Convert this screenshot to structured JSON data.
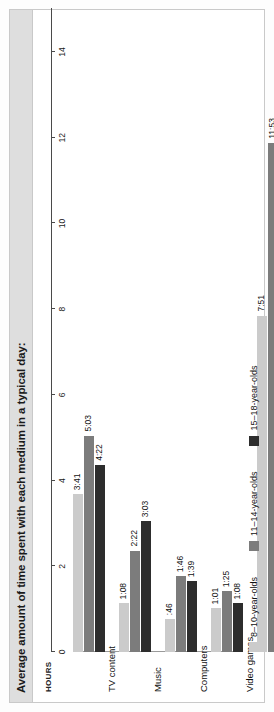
{
  "figure": {
    "title": "Average amount of time spent with each medium in a typical day:"
  },
  "chart_data": {
    "type": "bar",
    "orientation": "horizontal",
    "title": "Average amount of time spent with each medium in a typical day:",
    "xlabel": "HOURS",
    "ylabel": "",
    "axis_title": "HOURS",
    "xlim": [
      0,
      14
    ],
    "ticks": [
      0,
      2,
      4,
      6,
      8,
      10,
      12,
      14
    ],
    "tick_labels": [
      "0",
      "2",
      "4",
      "6",
      "8",
      "10",
      "12",
      "14"
    ],
    "grid": false,
    "legend_position": "bottom",
    "categories": [
      "TV content",
      "Music",
      "Computers",
      "Video games",
      "Total media exposure",
      "Total media use"
    ],
    "series": [
      {
        "name": "8–10-year-olds",
        "color": "#cbcbcb",
        "labels": [
          "3:41",
          "1:08",
          ":46",
          "1:01",
          "7:51",
          "5:29"
        ],
        "values": [
          3.683,
          1.133,
          0.767,
          1.017,
          7.85,
          5.483
        ]
      },
      {
        "name": "11–14-year-olds",
        "color": "#7c7c7c",
        "labels": [
          "5:03",
          "2:22",
          "1:46",
          "1:25",
          "11:53",
          "8:40"
        ],
        "values": [
          5.05,
          2.367,
          1.767,
          1.417,
          11.883,
          8.667
        ]
      },
      {
        "name": "15–18-year-olds",
        "color": "#2d2d2d",
        "labels": [
          "4:22",
          "3:03",
          "1:39",
          "1:08",
          "11:23",
          "7:58"
        ],
        "values": [
          4.367,
          3.05,
          1.65,
          1.133,
          11.383,
          7.967
        ]
      }
    ]
  },
  "legend": {
    "items": [
      {
        "label": "8–10-year-olds",
        "color": "#cbcbcb"
      },
      {
        "label": "11–14-year-olds",
        "color": "#7c7c7c"
      },
      {
        "label": "15–18-year-olds",
        "color": "#2d2d2d"
      }
    ]
  }
}
